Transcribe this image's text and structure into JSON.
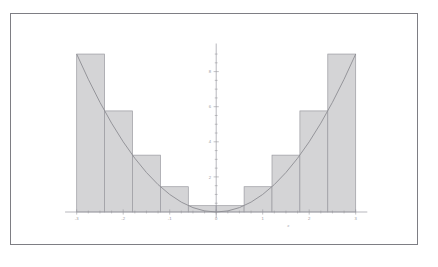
{
  "figure": {
    "title": "",
    "frame_color": "#7e7e84",
    "background": "#ffffff"
  },
  "chart_data": {
    "type": "bar",
    "title": "",
    "subtitle": "",
    "xlabel": "x",
    "ylabel": "",
    "xlim": [
      -3.25,
      3.25
    ],
    "ylim": [
      -0.35,
      9.6
    ],
    "grid": false,
    "legend": null,
    "legend_position": "none",
    "axis_color": "#9a9aa0",
    "curve": {
      "name": "y = x^2",
      "expression": "x^2",
      "color": "#8d8d93",
      "linewidth": 0.9,
      "x_start": -3.0,
      "x_end": 3.0,
      "x": [
        -3.0,
        -2.75,
        -2.5,
        -2.25,
        -2.0,
        -1.75,
        -1.5,
        -1.25,
        -1.0,
        -0.75,
        -0.5,
        -0.25,
        0.0,
        0.25,
        0.5,
        0.75,
        1.0,
        1.25,
        1.5,
        1.75,
        2.0,
        2.25,
        2.5,
        2.75,
        3.0
      ],
      "y": [
        9.0,
        7.5625,
        6.25,
        5.0625,
        4.0,
        3.0625,
        2.25,
        1.5625,
        1.0,
        0.5625,
        0.25,
        0.0625,
        0.0,
        0.0625,
        0.25,
        0.5625,
        1.0,
        1.5625,
        2.25,
        3.0625,
        4.0,
        5.0625,
        6.25,
        7.5625,
        9.0
      ]
    },
    "bars": {
      "fill_color": "#d4d4d6",
      "edge_color": "#9a9aa0",
      "width": 0.6,
      "left_rule": "outer endpoint (upper Riemann sum)",
      "left_edges": [
        -3.0,
        -2.4,
        -1.8,
        -1.2,
        -0.6,
        0.0,
        0.6,
        1.2,
        1.8,
        2.4
      ],
      "categories": [
        "[-3.0,-2.4]",
        "[-2.4,-1.8]",
        "[-1.8,-1.2]",
        "[-1.2,-0.6]",
        "[-0.6,0.0]",
        "[0.0,0.6]",
        "[0.6,1.2]",
        "[1.2,1.8]",
        "[1.8,2.4]",
        "[2.4,3.0]"
      ],
      "values": [
        9.0,
        5.76,
        3.24,
        1.44,
        0.36,
        0.36,
        1.44,
        3.24,
        5.76,
        9.0
      ]
    },
    "x_ticks": [
      -3,
      -2,
      -1,
      0,
      1,
      2,
      3
    ],
    "x_tick_labels": [
      "-3",
      "-2",
      "-1",
      "0",
      "1",
      "2",
      "3"
    ],
    "x_minor_ticks": [
      -2.75,
      -2.5,
      -2.25,
      -1.75,
      -1.5,
      -1.25,
      -0.75,
      -0.5,
      -0.25,
      0.25,
      0.5,
      0.75,
      1.25,
      1.5,
      1.75,
      2.25,
      2.5,
      2.75
    ],
    "y_ticks": [
      2,
      4,
      6,
      8
    ],
    "y_tick_labels": [
      "2",
      "4",
      "6",
      "8"
    ],
    "y_minor_ticks": [
      0.5,
      1,
      1.5,
      2.5,
      3,
      3.5,
      4.5,
      5,
      5.5,
      6.5,
      7,
      7.5,
      8.5,
      9
    ]
  }
}
